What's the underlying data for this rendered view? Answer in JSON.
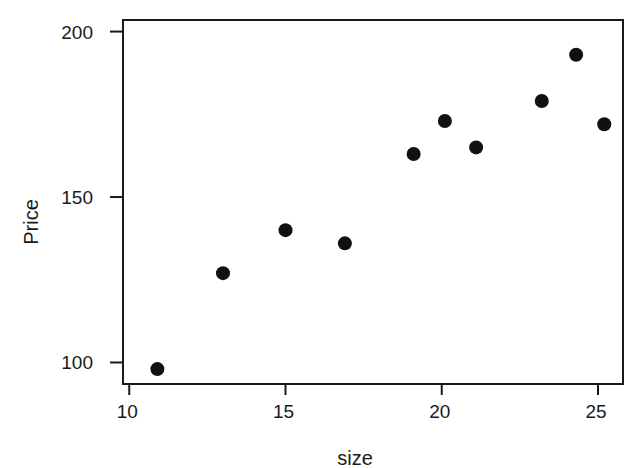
{
  "chart_data": {
    "type": "scatter",
    "title": "",
    "xlabel": "size",
    "ylabel": "Price",
    "xlim": [
      9.8,
      25.8
    ],
    "ylim": [
      93.5,
      203.5
    ],
    "xticks": [
      10,
      15,
      20,
      25
    ],
    "yticks": [
      100,
      150,
      200
    ],
    "xtick_labels": [
      "10",
      "15",
      "20",
      "25"
    ],
    "ytick_labels": [
      "100",
      "150",
      "200"
    ],
    "grid": false,
    "legend": null,
    "marker": "filled-circle",
    "marker_color": "#111111",
    "series": [
      {
        "name": "Price vs size",
        "x": [
          10.9,
          13.0,
          15.0,
          16.9,
          19.1,
          20.1,
          21.1,
          23.2,
          24.3,
          25.2
        ],
        "y": [
          98,
          127,
          140,
          136,
          163,
          173,
          165,
          179,
          193,
          172
        ]
      }
    ]
  }
}
